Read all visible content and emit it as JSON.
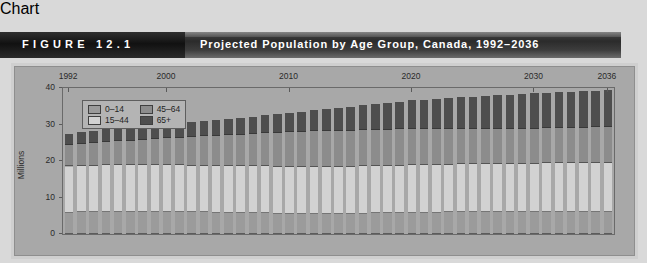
{
  "header": {
    "figure_label": "FIGURE 12.1",
    "title": "Projected Population by Age Group, Canada, 1992–2036"
  },
  "legend": {
    "items": [
      {
        "label": "0–14",
        "color": "#9b9b9b"
      },
      {
        "label": "45–64",
        "color": "#8c8c8c"
      },
      {
        "label": "15–44",
        "color": "#d2d2d2"
      },
      {
        "label": "65+",
        "color": "#4e4e4e"
      }
    ]
  },
  "chart_data": {
    "type": "bar",
    "subtype": "stacked",
    "title": "Projected Population by Age Group, Canada, 1992–2036",
    "xlabel": "",
    "ylabel": "Millions",
    "ylim": [
      0,
      40
    ],
    "yticks": [
      0,
      10,
      20,
      30,
      40
    ],
    "xticks_shown": [
      "1992",
      "2000",
      "2010",
      "2020",
      "2030",
      "2036"
    ],
    "xtick_label_position": "top",
    "grid": false,
    "legend_position": "top-left-inside",
    "categories": [
      "1992",
      "1993",
      "1994",
      "1995",
      "1996",
      "1997",
      "1998",
      "1999",
      "2000",
      "2001",
      "2002",
      "2003",
      "2004",
      "2005",
      "2006",
      "2007",
      "2008",
      "2009",
      "2010",
      "2011",
      "2012",
      "2013",
      "2014",
      "2015",
      "2016",
      "2017",
      "2018",
      "2019",
      "2020",
      "2021",
      "2022",
      "2023",
      "2024",
      "2025",
      "2026",
      "2027",
      "2028",
      "2029",
      "2030",
      "2031",
      "2032",
      "2033",
      "2034",
      "2035",
      "2036"
    ],
    "series": [
      {
        "name": "0–14",
        "color": "#9b9b9b",
        "values": [
          5.8,
          5.9,
          5.9,
          6.0,
          6.0,
          6.0,
          6.0,
          6.0,
          6.0,
          6.0,
          5.9,
          5.9,
          5.8,
          5.8,
          5.7,
          5.7,
          5.7,
          5.6,
          5.6,
          5.6,
          5.6,
          5.6,
          5.6,
          5.6,
          5.6,
          5.7,
          5.7,
          5.7,
          5.8,
          5.8,
          5.8,
          5.9,
          5.9,
          5.9,
          5.9,
          6.0,
          6.0,
          6.0,
          6.0,
          6.0,
          6.0,
          6.0,
          6.0,
          6.0,
          6.0
        ]
      },
      {
        "name": "15–44",
        "color": "#d2d2d2",
        "values": [
          12.7,
          12.8,
          12.8,
          12.8,
          12.8,
          12.8,
          12.8,
          12.8,
          12.8,
          12.8,
          12.8,
          12.8,
          12.8,
          12.8,
          12.8,
          12.8,
          12.8,
          12.8,
          12.8,
          12.8,
          12.8,
          12.8,
          12.8,
          12.8,
          12.9,
          12.9,
          12.9,
          13.0,
          13.0,
          13.0,
          13.1,
          13.1,
          13.2,
          13.2,
          13.2,
          13.3,
          13.3,
          13.3,
          13.3,
          13.4,
          13.4,
          13.4,
          13.4,
          13.4,
          13.4
        ]
      },
      {
        "name": "45–64",
        "color": "#8c8c8c",
        "values": [
          5.8,
          6.0,
          6.2,
          6.4,
          6.6,
          6.8,
          7.0,
          7.2,
          7.4,
          7.6,
          7.9,
          8.1,
          8.3,
          8.5,
          8.7,
          8.9,
          9.1,
          9.3,
          9.5,
          9.6,
          9.7,
          9.8,
          9.9,
          9.9,
          10.0,
          10.0,
          10.0,
          10.0,
          10.0,
          9.9,
          9.9,
          9.8,
          9.8,
          9.7,
          9.7,
          9.6,
          9.6,
          9.6,
          9.6,
          9.6,
          9.6,
          9.7,
          9.7,
          9.8,
          9.9
        ]
      },
      {
        "name": "65+",
        "color": "#4e4e4e",
        "values": [
          3.2,
          3.3,
          3.4,
          3.5,
          3.6,
          3.6,
          3.7,
          3.8,
          3.9,
          4.0,
          4.1,
          4.2,
          4.3,
          4.4,
          4.5,
          4.7,
          4.9,
          5.1,
          5.3,
          5.5,
          5.8,
          6.0,
          6.3,
          6.5,
          6.8,
          7.0,
          7.3,
          7.5,
          7.8,
          8.0,
          8.2,
          8.4,
          8.6,
          8.8,
          9.0,
          9.2,
          9.3,
          9.5,
          9.6,
          9.7,
          9.8,
          9.9,
          10.0,
          10.1,
          10.2
        ]
      }
    ]
  }
}
